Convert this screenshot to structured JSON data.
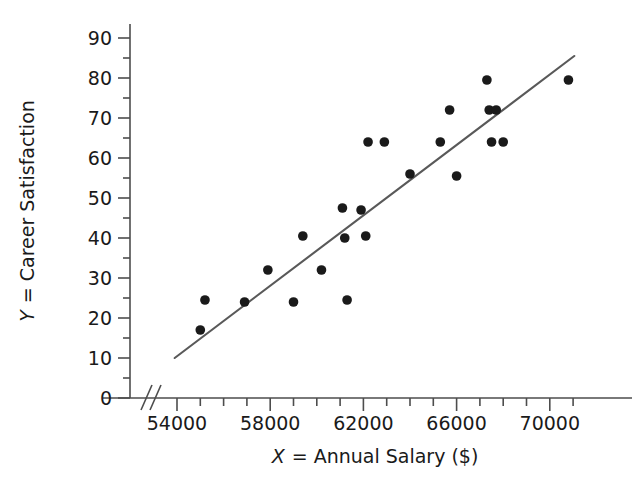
{
  "chart_data": {
    "type": "scatter",
    "title": "",
    "xlabel": "X = Annual Salary ($)",
    "ylabel": "Y = Career Satisfaction",
    "xlabel_var": "X",
    "xlabel_rest": "= Annual Salary ($)",
    "ylabel_var": "Y",
    "ylabel_rest": "= Career Satisfaction",
    "xlim": [
      53000,
      71500
    ],
    "ylim": [
      0,
      92
    ],
    "x_ticks": [
      54000,
      56000,
      58000,
      60000,
      62000,
      64000,
      66000,
      68000,
      70000
    ],
    "x_tick_labels": [
      "54000",
      "",
      "58000",
      "",
      "62000",
      "",
      "66000",
      "",
      "70000"
    ],
    "x_minor_step": 1000,
    "y_ticks": [
      0,
      10,
      20,
      30,
      40,
      50,
      60,
      70,
      80,
      90
    ],
    "y_tick_labels": [
      "0",
      "10",
      "20",
      "30",
      "40",
      "50",
      "60",
      "70",
      "80",
      "90"
    ],
    "y_minor_step": 5,
    "grid": false,
    "legend": null,
    "axis_break": {
      "axis": "x",
      "symbol": "//",
      "position_note": "between origin and 54000"
    },
    "marker": {
      "shape": "circle",
      "color": "#1a1a1a",
      "size": 7
    },
    "points": [
      {
        "x": 55000,
        "y": 17
      },
      {
        "x": 55200,
        "y": 24.5
      },
      {
        "x": 56900,
        "y": 24
      },
      {
        "x": 57900,
        "y": 32
      },
      {
        "x": 59000,
        "y": 24
      },
      {
        "x": 59400,
        "y": 40.5
      },
      {
        "x": 60200,
        "y": 32
      },
      {
        "x": 61100,
        "y": 47.5
      },
      {
        "x": 61200,
        "y": 40
      },
      {
        "x": 61300,
        "y": 24.5
      },
      {
        "x": 61900,
        "y": 47
      },
      {
        "x": 62100,
        "y": 40.5
      },
      {
        "x": 62200,
        "y": 64
      },
      {
        "x": 62900,
        "y": 64
      },
      {
        "x": 64000,
        "y": 56
      },
      {
        "x": 65300,
        "y": 64
      },
      {
        "x": 65700,
        "y": 72
      },
      {
        "x": 66000,
        "y": 55.5
      },
      {
        "x": 67300,
        "y": 79.5
      },
      {
        "x": 67400,
        "y": 72
      },
      {
        "x": 67700,
        "y": 72
      },
      {
        "x": 67500,
        "y": 64
      },
      {
        "x": 68000,
        "y": 64
      },
      {
        "x": 70800,
        "y": 79.5
      }
    ],
    "trend_line": {
      "type": "linear-fit",
      "color": "#595959",
      "x_start": 53900,
      "y_start": 10,
      "x_end": 71050,
      "y_end": 85.5
    }
  },
  "geometry": {
    "plot_left_px": 130,
    "plot_right_px": 620,
    "y_zero_px": 398,
    "y_top_px": 38,
    "x_54000_px": 177,
    "px_per_1000x": 23.3,
    "px_per_unit_y": 4.0
  }
}
